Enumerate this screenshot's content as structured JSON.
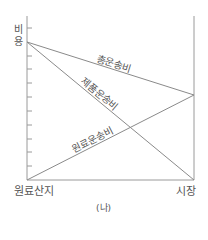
{
  "diagram": {
    "caption": "(나)",
    "y_axis_label_chars": [
      "비",
      "용"
    ],
    "x_axis": {
      "left_label": "원료산지",
      "right_label": "시장"
    },
    "lines": [
      {
        "name": "총운송비",
        "from": [
          27,
          42
        ],
        "to": [
          194,
          95
        ]
      },
      {
        "name": "제품운송비",
        "from": [
          27,
          42
        ],
        "to": [
          194,
          180
        ]
      },
      {
        "name": "원료운송비",
        "from": [
          27,
          180
        ],
        "to": [
          194,
          95
        ]
      }
    ],
    "tick_count": 11,
    "colors": {
      "line": "#8a8a8a",
      "axis": "#9a9a9a",
      "text": "#555555"
    }
  }
}
